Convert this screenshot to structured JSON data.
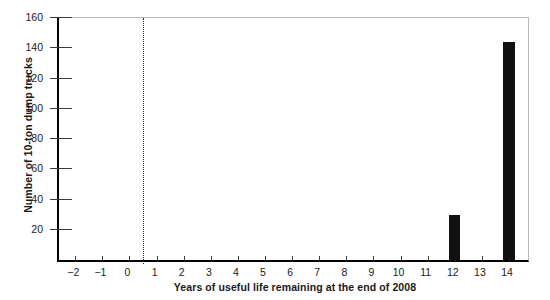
{
  "chart_data": {
    "type": "bar",
    "title": "",
    "subtitle": "",
    "xlabel": "Years of useful life remaining at the end of 2008",
    "ylabel": "Number of 10-ton dump trucks",
    "categories": [
      "-2",
      "-1",
      "0",
      "1",
      "2",
      "3",
      "4",
      "5",
      "6",
      "7",
      "8",
      "9",
      "10",
      "11",
      "12",
      "13",
      "14"
    ],
    "x": [
      -2,
      -1,
      0,
      1,
      2,
      3,
      4,
      5,
      6,
      7,
      8,
      9,
      10,
      11,
      12,
      13,
      14
    ],
    "values": [
      0,
      0,
      0,
      0,
      0,
      0,
      0,
      0,
      0,
      0,
      0,
      0,
      0,
      0,
      30,
      0,
      144
    ],
    "xlim": [
      -2.6,
      14.7
    ],
    "ylim": [
      0,
      160
    ],
    "ytick_labels": [
      "0",
      "20",
      "40",
      "60",
      "80",
      "100",
      "120",
      "140",
      "160"
    ],
    "ytick_values": [
      0,
      20,
      40,
      60,
      80,
      100,
      120,
      140,
      160
    ],
    "xtick_labels": [
      "-2",
      "-1",
      "0",
      "1",
      "2",
      "3",
      "4",
      "5",
      "6",
      "7",
      "8",
      "9",
      "10",
      "11",
      "12",
      "13",
      "14"
    ],
    "xtick_values": [
      -2,
      -1,
      0,
      1,
      2,
      3,
      4,
      5,
      6,
      7,
      8,
      9,
      10,
      11,
      12,
      13,
      14
    ],
    "grid": false,
    "legend": null,
    "legend_position": "none",
    "annotations": [
      {
        "name": "reference-line",
        "type": "vertical-dashed-line",
        "x": 0.5,
        "style": "dotted",
        "color": "#2b2b2b"
      }
    ],
    "bar_color": "#111111",
    "bar_width": 0.42,
    "axis_color": "#000000",
    "frame_color": "#b9b9b9"
  }
}
